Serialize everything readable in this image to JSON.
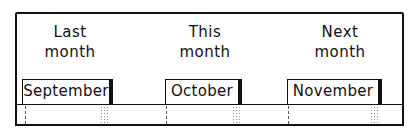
{
  "columns": [
    {
      "heading_line1": "Last",
      "heading_line2": "month",
      "month": "September"
    },
    {
      "heading_line1": "This",
      "heading_line2": "month",
      "month": "October"
    },
    {
      "heading_line1": "Next",
      "heading_line2": "month",
      "month": "November"
    }
  ]
}
